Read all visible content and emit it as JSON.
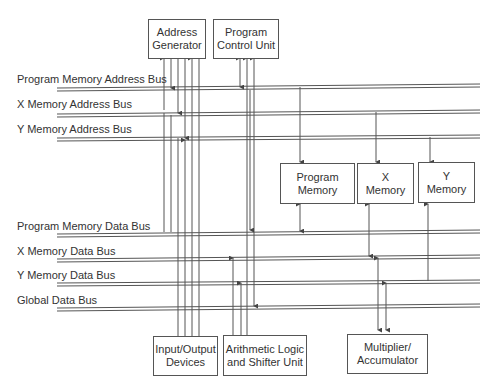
{
  "diagram": {
    "type": "DSP bus architecture block diagram",
    "buses": [
      {
        "label": "Program Memory Address Bus"
      },
      {
        "label": "X Memory Address Bus"
      },
      {
        "label": "Y Memory Address Bus"
      },
      {
        "label": "Program Memory Data Bus"
      },
      {
        "label": "X Memory Data Bus"
      },
      {
        "label": "Y Memory Data Bus"
      },
      {
        "label": "Global Data Bus"
      }
    ],
    "blocks": {
      "address_generator": {
        "line1": "Address",
        "line2": "Generator"
      },
      "program_control_unit": {
        "line1": "Program",
        "line2": "Control Unit"
      },
      "program_memory": {
        "line1": "Program",
        "line2": "Memory"
      },
      "x_memory": {
        "line1": "X",
        "line2": "Memory"
      },
      "y_memory": {
        "line1": "Y",
        "line2": "Memory"
      },
      "io_devices": {
        "line1": "Input/Output",
        "line2": "Devices"
      },
      "alu": {
        "line1": "Arithmetic Logic",
        "line2": "and Shifter Unit"
      },
      "mac": {
        "line1": "Multiplier/",
        "line2": "Accumulator"
      }
    },
    "colors": {
      "line": "#555555",
      "text": "#333333",
      "background": "#ffffff"
    }
  }
}
